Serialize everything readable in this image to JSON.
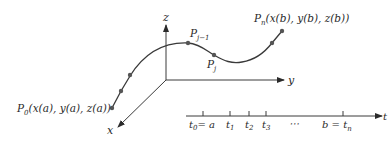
{
  "diagram": {
    "type": "parametric-curve-partition",
    "colors": {
      "ink": "#3a3a3a",
      "point": "#555555",
      "background": "#ffffff"
    },
    "axes3d": {
      "z_label": "z",
      "y_label": "y",
      "x_label": "x"
    },
    "points": {
      "start": {
        "name": "P",
        "sub": "0",
        "coords": "(x(a), y(a), z(a))"
      },
      "prev": {
        "name": "P",
        "sub": "j−1"
      },
      "current": {
        "name": "P",
        "sub": "j"
      },
      "end": {
        "name": "P",
        "sub": "n",
        "coords": "(x(b), y(b), z(b))"
      }
    },
    "t_axis": {
      "label": "t",
      "ticks": [
        {
          "main": "t",
          "sub": "0",
          "suffix": "= a"
        },
        {
          "main": "t",
          "sub": "1"
        },
        {
          "main": "t",
          "sub": "2"
        },
        {
          "main": "t",
          "sub": "3"
        },
        {
          "main": "⋯"
        },
        {
          "prefix": "b = ",
          "main": "t",
          "sub": "n"
        }
      ]
    }
  }
}
